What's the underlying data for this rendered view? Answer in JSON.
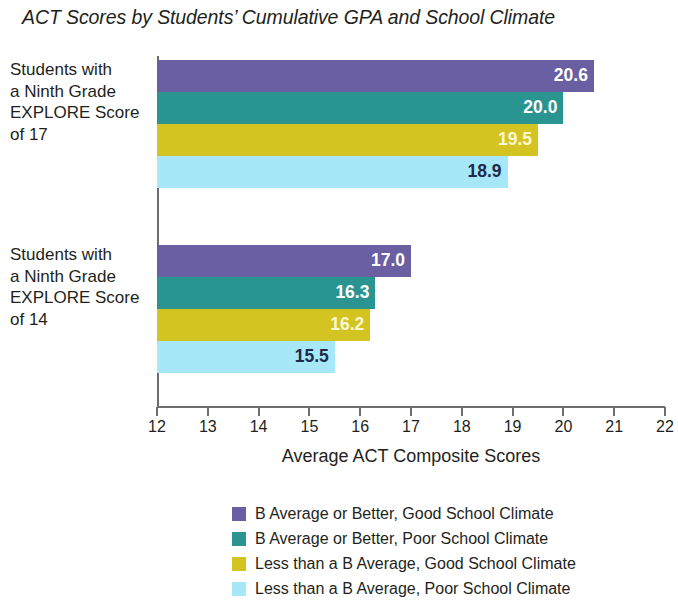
{
  "chart_data": {
    "type": "bar",
    "orientation": "horizontal",
    "title": "ACT Scores by Students’ Cumulative GPA and School Climate",
    "xlabel": "Average ACT Composite Scores",
    "ylabel": "",
    "xlim": [
      12,
      22
    ],
    "xticks": [
      12,
      13,
      14,
      15,
      16,
      17,
      18,
      19,
      20,
      21,
      22
    ],
    "xtick_labels": [
      "12",
      "13",
      "14",
      "15",
      "16",
      "17",
      "18",
      "19",
      "20",
      "21",
      "22"
    ],
    "grid": false,
    "legend_position": "bottom",
    "categories": [
      "Students with a Ninth Grade EXPLORE Score of 17",
      "Students with a Ninth Grade EXPLORE Score of 14"
    ],
    "category_label_lines": [
      [
        "Students with",
        "a Ninth Grade",
        "EXPLORE Score",
        "of 17"
      ],
      [
        "Students with",
        "a Ninth Grade",
        "EXPLORE Score",
        "of 14"
      ]
    ],
    "series": [
      {
        "name": "B Average or Better, Good School Climate",
        "color": "#6a5fa3",
        "label_color": "#ffffff",
        "values": [
          20.6,
          17.0
        ],
        "value_labels": [
          "20.6",
          "17.0"
        ]
      },
      {
        "name": "B Average or Better, Poor School Climate",
        "color": "#2a9490",
        "label_color": "#ffffff",
        "values": [
          20.0,
          16.3
        ],
        "value_labels": [
          "20.0",
          "16.3"
        ]
      },
      {
        "name": "Less than a B Average, Good School Climate",
        "color": "#d3c422",
        "label_color": "#fdf7d0",
        "values": [
          19.5,
          16.2
        ],
        "value_labels": [
          "19.5",
          "16.2"
        ]
      },
      {
        "name": "Less than a B Average, Poor School Climate",
        "color": "#a6e7f8",
        "label_color": "#1c2b4a",
        "values": [
          18.9,
          15.5
        ],
        "value_labels": [
          "18.9",
          "15.5"
        ]
      }
    ]
  },
  "legend": {
    "items": [
      {
        "label": "B Average or Better, Good School Climate",
        "color": "#6a5fa3"
      },
      {
        "label": "B Average or Better, Poor School Climate",
        "color": "#2a9490"
      },
      {
        "label": "Less than a B Average, Good School Climate",
        "color": "#d3c422"
      },
      {
        "label": "Less than a B Average, Poor School Climate",
        "color": "#a6e7f8"
      }
    ]
  },
  "axis": {
    "line_color": "#6d6e71"
  }
}
